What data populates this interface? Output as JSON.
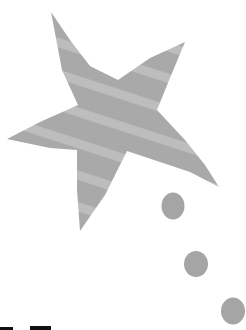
{
  "illustration": {
    "star": {
      "fill": "#a9a9a9",
      "stripe": "#bdbdbd",
      "points": "51,12 70,40 90,66 118,80 150,58 185,42 170,78 157,110 185,140 205,165 219,187 190,172 160,162 127,151 105,195 80,231 77,190 77,150 50,148 7,139 40,122 78,105 62,70"
    },
    "dots": [
      {
        "cx": 173,
        "cy": 206,
        "rx": 11.5,
        "ry": 13.5,
        "fill": "#a5a5a5"
      },
      {
        "cx": 196,
        "cy": 264,
        "rx": 12,
        "ry": 13,
        "fill": "#a5a5a5"
      },
      {
        "cx": 233,
        "cy": 311,
        "rx": 12,
        "ry": 13.5,
        "fill": "#a5a5a5"
      }
    ],
    "bottom_text_fragments_color": "#111111"
  }
}
